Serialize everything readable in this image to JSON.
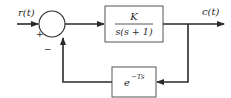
{
  "diagram": {
    "type": "feedback-control-block-diagram",
    "input_label": "r(t)",
    "output_label": "c(t)",
    "summing_junction": {
      "plus_sign": "+",
      "minus_sign": "−"
    },
    "forward_block": {
      "numerator": "K",
      "denominator": "s(s + 1)"
    },
    "feedback_block": {
      "base": "e",
      "exponent": "−Ts"
    },
    "colors": {
      "line": "#2a2a2a",
      "box_border": "#555555",
      "background": "#ffffff"
    }
  }
}
